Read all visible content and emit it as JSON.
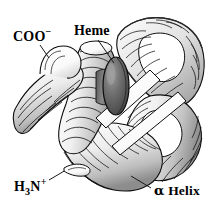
{
  "figure": {
    "background_color": "#ffffff",
    "width": 214,
    "height": 212,
    "style": "black-and-white shaded ribbon illustration"
  },
  "labels": {
    "carboxyl_terminus": {
      "text": "COO",
      "charge": "−",
      "name": "carboxyl-terminus-label"
    },
    "heme": {
      "text": "Heme",
      "name": "heme-label"
    },
    "amino_terminus": {
      "element": "H",
      "count": "3",
      "nitrogen": "N",
      "charge": "+",
      "name": "amino-terminus-label"
    },
    "alpha_helix": {
      "greek": "α",
      "text": " Helix",
      "name": "alpha-helix-label"
    }
  },
  "graphic": {
    "outline_color": "#000000",
    "ribbon_fill_light": "#ffffff",
    "ribbon_fill_mid": "#d8d8d8",
    "ribbon_fill_shadow": "#8f8f8f",
    "heme_fill_dark": "#4a4a4a",
    "heme_fill_mid": "#7c7c7c",
    "leader_line_color": "#1a1a1a",
    "elements": [
      "alpha-helix-coils",
      "heme-disc",
      "connecting-loops",
      "leader-lines"
    ]
  }
}
